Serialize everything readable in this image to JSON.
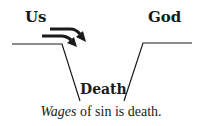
{
  "diagram": {
    "left_label": "Us",
    "right_label": "God",
    "bottom_label": "Death",
    "caption_italic": "Wages",
    "caption_rest": " of sin is death.",
    "colors": {
      "ink": "#1a1a1a",
      "background": "#ffffff"
    },
    "icons": {
      "arrows": "double-arrow-down-right-icon"
    }
  }
}
